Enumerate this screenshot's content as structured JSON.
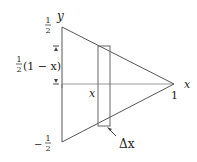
{
  "diagram": {
    "labels": {
      "y_axis": "y",
      "x_axis": "x",
      "top_value_num": "1",
      "top_value_den": "2",
      "bottom_value_sign": "−",
      "bottom_value_num": "1",
      "bottom_value_den": "2",
      "height_frac_num": "1",
      "height_frac_den": "2",
      "height_expr": "(1 − x)",
      "slab_position": "x",
      "apex_value": "1",
      "slab_width": "Δx"
    },
    "colors": {
      "line": "#555555",
      "axis": "#888888",
      "text": "#222222"
    }
  }
}
